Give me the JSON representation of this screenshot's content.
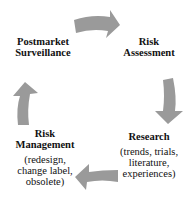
{
  "diagram": {
    "type": "cycle",
    "arrow_color": "#9a9a9a",
    "nodes": [
      {
        "id": "postmarket",
        "title_line1": "Postmarket",
        "title_line2": "Surveillance"
      },
      {
        "id": "risk-assessment",
        "title_line1": "Risk",
        "title_line2": "Assessment"
      },
      {
        "id": "research",
        "title_line1": "Research",
        "sub_line1": "(trends, trials,",
        "sub_line2": "literature,",
        "sub_line3": "experiences)"
      },
      {
        "id": "risk-management",
        "title_line1": "Risk",
        "title_line2": "Management",
        "sub_line1": "(redesign,",
        "sub_line2": "change label,",
        "sub_line3": "obsolete)"
      }
    ],
    "edges": [
      {
        "from": "postmarket",
        "to": "risk-assessment"
      },
      {
        "from": "risk-assessment",
        "to": "research"
      },
      {
        "from": "research",
        "to": "risk-management"
      },
      {
        "from": "risk-management",
        "to": "postmarket"
      }
    ]
  }
}
